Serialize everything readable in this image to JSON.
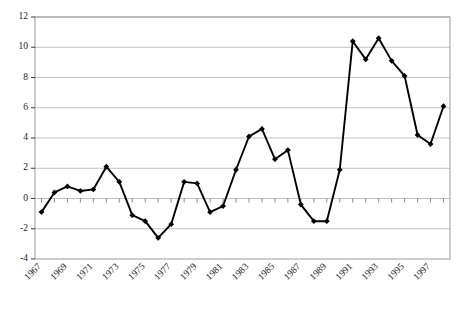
{
  "chart_data": {
    "type": "line",
    "title": "",
    "subtitle": "",
    "xlabel": "",
    "ylabel": "",
    "grid": true,
    "legend": false,
    "legend_position": "none",
    "marker": "diamond",
    "line_color": "#000000",
    "marker_color": "#000000",
    "grid_color": "#b0b0b0",
    "axis_color": "#808080",
    "xlim": [
      1966.5,
      1998.5
    ],
    "ylim": [
      -4,
      12
    ],
    "ytick_step": 2,
    "yticks": [
      -4,
      -2,
      0,
      2,
      4,
      6,
      8,
      10,
      12
    ],
    "ytick_labels": [
      "-4",
      "-2",
      "0",
      "2",
      "4",
      "6",
      "8",
      "10",
      "12"
    ],
    "xticks": [
      1967,
      1968,
      1969,
      1970,
      1971,
      1972,
      1973,
      1974,
      1975,
      1976,
      1977,
      1978,
      1979,
      1980,
      1981,
      1982,
      1983,
      1984,
      1985,
      1986,
      1987,
      1988,
      1989,
      1990,
      1991,
      1992,
      1993,
      1994,
      1995,
      1996,
      1997,
      1998
    ],
    "xtick_labels_shown": [
      "1967",
      "1969",
      "1971",
      "1973",
      "1975",
      "1977",
      "1979",
      "1981",
      "1983",
      "1985",
      "1987",
      "1989",
      "1991",
      "1993",
      "1995",
      "1997"
    ],
    "xtick_label_rotation": -45,
    "x": [
      1967,
      1968,
      1969,
      1970,
      1971,
      1972,
      1973,
      1974,
      1975,
      1976,
      1977,
      1978,
      1979,
      1980,
      1981,
      1982,
      1983,
      1984,
      1985,
      1986,
      1987,
      1988,
      1989,
      1990,
      1991,
      1992,
      1993,
      1994,
      1995,
      1996,
      1997,
      1998
    ],
    "values": [
      -0.9,
      0.4,
      0.8,
      0.5,
      0.6,
      2.1,
      1.1,
      -1.1,
      -1.5,
      -2.6,
      -1.7,
      1.1,
      1.0,
      -0.9,
      -0.5,
      1.9,
      4.1,
      4.6,
      2.6,
      3.2,
      -0.4,
      -1.5,
      -1.5,
      1.9,
      10.4,
      9.2,
      10.6,
      9.1,
      8.1,
      4.2,
      3.6,
      6.1
    ]
  },
  "plot": {
    "left": 35,
    "right": 450,
    "top": 17,
    "bottom": 259,
    "border_color": "#9a9a9a"
  }
}
